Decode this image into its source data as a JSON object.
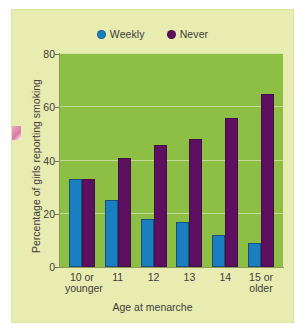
{
  "chart_data": {
    "type": "bar",
    "title": "",
    "xlabel": "Age at menarche",
    "ylabel": "Percentage of girls reporting smoking",
    "categories": [
      "10 or younger",
      "11",
      "12",
      "13",
      "14",
      "15 or older"
    ],
    "category_lines": [
      [
        "10 or",
        "younger"
      ],
      [
        "11",
        ""
      ],
      [
        "12",
        ""
      ],
      [
        "13",
        ""
      ],
      [
        "14",
        ""
      ],
      [
        "15 or",
        "older"
      ]
    ],
    "series": [
      {
        "name": "Weekly",
        "color": "#1a7fc0",
        "values": [
          33,
          25,
          18,
          17,
          12,
          9
        ]
      },
      {
        "name": "Never",
        "color": "#5e1060",
        "values": [
          33,
          41,
          46,
          48,
          56,
          65
        ]
      }
    ],
    "ylim": [
      0,
      80
    ],
    "yticks": [
      0,
      20,
      40,
      60,
      80
    ],
    "ytick_labels": [
      "0",
      "20",
      "40",
      "60",
      "80"
    ],
    "grid": true,
    "legend_position": "top-center",
    "plot_background": "#8cbf43",
    "figure_background": "#e8ecb0",
    "gridline_color": "#cfe0a4"
  },
  "legend": {
    "items": [
      {
        "label": "Weekly",
        "marker": "circle",
        "color": "#1a7fc0"
      },
      {
        "label": "Never",
        "marker": "circle",
        "color": "#5e1060"
      }
    ]
  }
}
